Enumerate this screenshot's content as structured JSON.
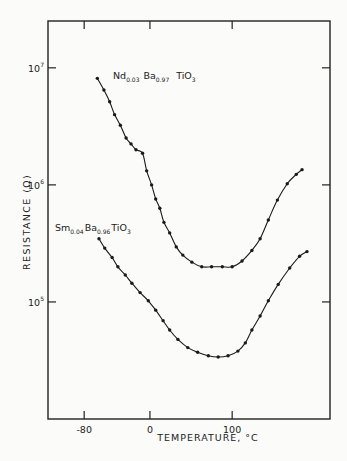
{
  "chart_data": {
    "type": "line",
    "title": "",
    "xlabel": "TEMPERATURE, °C",
    "ylabel": "RESISTANCE (Ω)",
    "yscale": "log",
    "xlim": [
      -124,
      219
    ],
    "ylim_log10": [
      4.0,
      7.4
    ],
    "x_ticks": [
      {
        "value": -80,
        "label": "-80"
      },
      {
        "value": 0,
        "label": "0"
      },
      {
        "value": 100,
        "label": "100"
      }
    ],
    "y_ticks": [
      {
        "value_log10": 7,
        "base": "10",
        "exp": "7"
      },
      {
        "value_log10": 6,
        "base": "10",
        "exp": "6"
      },
      {
        "value_log10": 5,
        "base": "10",
        "exp": "5"
      }
    ],
    "grid": false,
    "legend": "none (inline curve labels)",
    "series": [
      {
        "name": "Nd0.03 Ba0.97 TiO3",
        "label_parts": {
          "el1": "Nd",
          "s1": "0.03",
          "el2": "Ba",
          "s2": "0.97",
          "el3": "TiO",
          "s3": "3"
        },
        "points_T_log10R": [
          [
            -64,
            6.91
          ],
          [
            -56,
            6.81
          ],
          [
            -49,
            6.71
          ],
          [
            -43,
            6.6
          ],
          [
            -36,
            6.51
          ],
          [
            -29,
            6.4
          ],
          [
            -23,
            6.35
          ],
          [
            -17,
            6.3
          ],
          [
            -9,
            6.27
          ],
          [
            -4,
            6.12
          ],
          [
            2,
            6.0
          ],
          [
            7,
            5.88
          ],
          [
            12,
            5.8
          ],
          [
            17,
            5.68
          ],
          [
            24,
            5.59
          ],
          [
            32,
            5.47
          ],
          [
            40,
            5.4
          ],
          [
            51,
            5.34
          ],
          [
            63,
            5.3
          ],
          [
            75,
            5.3
          ],
          [
            88,
            5.3
          ],
          [
            100,
            5.3
          ],
          [
            112,
            5.35
          ],
          [
            124,
            5.44
          ],
          [
            134,
            5.54
          ],
          [
            144,
            5.7
          ],
          [
            155,
            5.87
          ],
          [
            167,
            6.01
          ],
          [
            178,
            6.09
          ],
          [
            185,
            6.13
          ]
        ]
      },
      {
        "name": "Sm0.04 Ba0.96 TiO3",
        "label_parts": {
          "el1": "Sm",
          "s1": "0.04",
          "el2": "Ba",
          "s2": "0.96",
          "el3": "TiO",
          "s3": "3"
        },
        "points_T_log10R": [
          [
            -62,
            5.54
          ],
          [
            -55,
            5.46
          ],
          [
            -46,
            5.38
          ],
          [
            -39,
            5.3
          ],
          [
            -30,
            5.23
          ],
          [
            -22,
            5.16
          ],
          [
            -12,
            5.08
          ],
          [
            -2,
            5.01
          ],
          [
            7,
            4.93
          ],
          [
            16,
            4.84
          ],
          [
            24,
            4.76
          ],
          [
            34,
            4.68
          ],
          [
            46,
            4.61
          ],
          [
            58,
            4.57
          ],
          [
            71,
            4.54
          ],
          [
            83,
            4.53
          ],
          [
            95,
            4.54
          ],
          [
            107,
            4.58
          ],
          [
            116,
            4.65
          ],
          [
            124,
            4.76
          ],
          [
            134,
            4.88
          ],
          [
            144,
            5.01
          ],
          [
            156,
            5.15
          ],
          [
            170,
            5.29
          ],
          [
            182,
            5.39
          ],
          [
            191,
            5.43
          ]
        ]
      }
    ],
    "colors": {
      "ink": "#1a1a1a",
      "background": "#fbfbfa"
    }
  }
}
